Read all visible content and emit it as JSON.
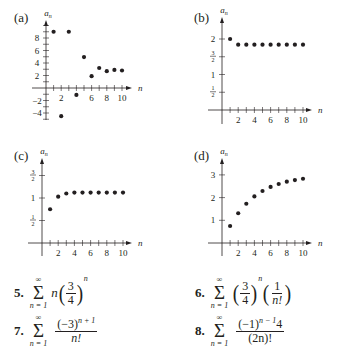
{
  "chart_data": [
    {
      "id": "a",
      "type": "scatter",
      "panel_label": "(a)",
      "xlabel": "n",
      "ylabel": "a_n",
      "xlim": [
        0,
        10.5
      ],
      "ylim": [
        -5,
        10
      ],
      "x_tick_labels": [
        "2",
        "6",
        "8",
        "10"
      ],
      "y_tick_labels": [
        "8",
        "6",
        "4",
        "2",
        "-2",
        "-4"
      ],
      "x": [
        1,
        2,
        3,
        4,
        5,
        6,
        7,
        8,
        9,
        10
      ],
      "values": [
        9,
        -4.5,
        9,
        -1.1,
        4.95,
        1.9,
        3.2,
        2.7,
        2.9,
        2.8
      ],
      "grid": false
    },
    {
      "id": "b",
      "type": "scatter",
      "panel_label": "(b)",
      "xlabel": "n",
      "ylabel": "a_n",
      "xlim": [
        0,
        10.5
      ],
      "ylim": [
        0,
        2.3
      ],
      "x_tick_labels": [
        "2",
        "4",
        "6",
        "8",
        "10"
      ],
      "y_tick_labels": [
        "2",
        "3/2",
        "1",
        "1/2"
      ],
      "x": [
        1,
        2,
        3,
        4,
        5,
        6,
        7,
        8,
        9,
        10
      ],
      "values": [
        2,
        1.84,
        1.84,
        1.84,
        1.84,
        1.84,
        1.84,
        1.84,
        1.84,
        1.84
      ],
      "grid": false
    },
    {
      "id": "c",
      "type": "scatter",
      "panel_label": "(c)",
      "xlabel": "n",
      "ylabel": "a_n",
      "xlim": [
        0,
        10.5
      ],
      "ylim": [
        0,
        1.8
      ],
      "x_tick_labels": [
        "2",
        "4",
        "6",
        "8",
        "10"
      ],
      "y_tick_labels": [
        "3/2",
        "1",
        "1/2"
      ],
      "x": [
        1,
        2,
        3,
        4,
        5,
        6,
        7,
        8,
        9,
        10
      ],
      "values": [
        0.75,
        1.03,
        1.1,
        1.12,
        1.12,
        1.12,
        1.12,
        1.12,
        1.12,
        1.12
      ],
      "grid": false
    },
    {
      "id": "d",
      "type": "scatter",
      "panel_label": "(d)",
      "xlabel": "n",
      "ylabel": "a_n",
      "xlim": [
        0,
        10.5
      ],
      "ylim": [
        0,
        3.6
      ],
      "x_tick_labels": [
        "2",
        "4",
        "6",
        "8",
        "10"
      ],
      "y_tick_labels": [
        "3",
        "2",
        "1"
      ],
      "x": [
        1,
        2,
        3,
        4,
        5,
        6,
        7,
        8,
        9,
        10
      ],
      "values": [
        0.75,
        1.31,
        1.73,
        2.05,
        2.29,
        2.47,
        2.6,
        2.7,
        2.77,
        2.83
      ],
      "grid": false
    }
  ],
  "formulas": [
    {
      "number": "5.",
      "sum_top": "∞",
      "sum_bottom": "n = 1",
      "term": "n(3/4)^n"
    },
    {
      "number": "6.",
      "sum_top": "∞",
      "sum_bottom": "n = 1",
      "term": "(3/4)^n(1/n!)"
    },
    {
      "number": "7.",
      "sum_top": "∞",
      "sum_bottom": "n = 1",
      "numerator": "(−3)",
      "numerator_exp": "n + 1",
      "denominator": "n!"
    },
    {
      "number": "8.",
      "sum_top": "∞",
      "sum_bottom": "n = 1",
      "numerator": "(−1)",
      "numerator_exp": "n − 1",
      "numerator_tail": "4",
      "denominator": "(2n)!"
    }
  ],
  "f5": {
    "coef": "n",
    "num": "3",
    "den": "4",
    "exp": "n"
  },
  "f6": {
    "num1": "3",
    "den1": "4",
    "exp": "n",
    "num2": "1",
    "den2": "n!"
  }
}
